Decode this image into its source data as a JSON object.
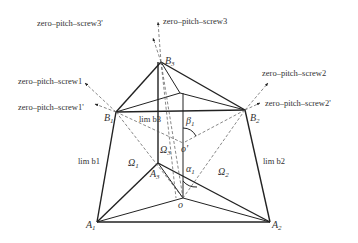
{
  "diagram": {
    "title": "",
    "points": {
      "B3": {
        "label": "B",
        "sub": "3",
        "x": 161,
        "y": 62
      },
      "B1": {
        "label": "B",
        "sub": "1",
        "x": 116,
        "y": 112
      },
      "B2": {
        "label": "B",
        "sub": "2",
        "x": 245,
        "y": 110
      },
      "A1": {
        "label": "A",
        "sub": "1",
        "x": 97,
        "y": 222
      },
      "A2": {
        "label": "A",
        "sub": "2",
        "x": 270,
        "y": 222
      },
      "A3": {
        "label": "A",
        "sub": "3",
        "x": 158,
        "y": 163
      },
      "o": {
        "label": "o",
        "x": 183,
        "y": 198
      },
      "o_prime": {
        "label": "o'",
        "x": 183,
        "y": 143
      }
    },
    "screw_labels": {
      "s1": "zero–pitch–screw1",
      "s1p": "zero–pitch–screw1'",
      "s2": "zero–pitch–screw2",
      "s2p": "zero–pitch–screw2'",
      "s3": "zero–pitch–screw3",
      "s3p": "zero–pitch–screw3'"
    },
    "limb_labels": {
      "b1": "lim b1",
      "b2": "lim b2",
      "b3": "lim b3"
    },
    "regions": {
      "omega1": {
        "label": "Ω",
        "sub": "1"
      },
      "omega2": {
        "label": "Ω",
        "sub": "2"
      },
      "omega3": {
        "label": "Ω",
        "sub": "3"
      }
    },
    "angles": {
      "alpha": {
        "label": "α",
        "sub": "1"
      },
      "beta": {
        "label": "β",
        "sub": "1"
      },
      "omega": {
        "label": "ω"
      }
    }
  }
}
